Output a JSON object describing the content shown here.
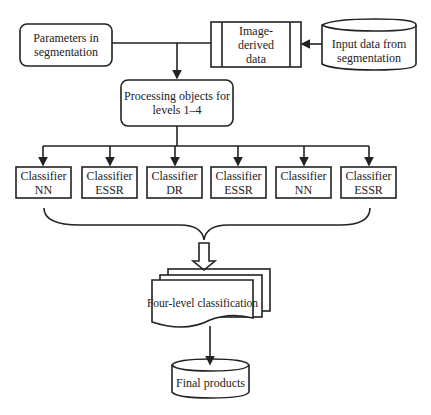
{
  "diagram": {
    "nodes": {
      "parameters": {
        "line1": "Parameters in",
        "line2": "segmentation"
      },
      "image_derived": {
        "line1": "Image-derived",
        "line2": "data"
      },
      "input_data": {
        "line1": "Input data from",
        "line2": "segmentation"
      },
      "processing": {
        "line1": "Processing objects for",
        "line2": "levels 1–4"
      },
      "classifiers": [
        {
          "line1": "Classifier",
          "line2": "NN"
        },
        {
          "line1": "Classifier",
          "line2": "ESSR"
        },
        {
          "line1": "Classifier",
          "line2": "DR"
        },
        {
          "line1": "Classifier",
          "line2": "ESSR"
        },
        {
          "line1": "Classifier",
          "line2": "NN"
        },
        {
          "line1": "Classifier",
          "line2": "ESSR"
        }
      ],
      "four_level": {
        "label": "Four-level classification"
      },
      "final_products": {
        "label": "Final products"
      }
    },
    "colors": {
      "stroke": "#222222",
      "background": "#ffffff"
    }
  }
}
